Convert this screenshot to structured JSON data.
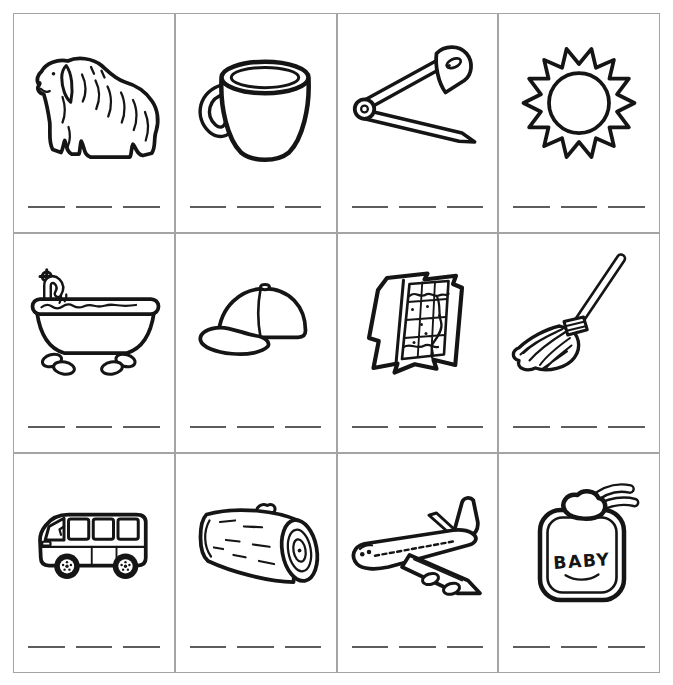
{
  "page": {
    "background_color": "#ffffff",
    "card_border_color": "#a4a4a4",
    "ink_color": "#151515",
    "blank_line_color": "#5d5d5d"
  },
  "worksheet": {
    "rows": 3,
    "columns": 4,
    "blanks_per_card": 3,
    "cards": [
      {
        "depicts": "dog"
      },
      {
        "depicts": "cup"
      },
      {
        "depicts": "safety pin"
      },
      {
        "depicts": "sun"
      },
      {
        "depicts": "bathtub"
      },
      {
        "depicts": "cap"
      },
      {
        "depicts": "map"
      },
      {
        "depicts": "mop"
      },
      {
        "depicts": "van"
      },
      {
        "depicts": "log"
      },
      {
        "depicts": "jet plane"
      },
      {
        "depicts": "baby bib",
        "label": "BABY"
      }
    ]
  }
}
